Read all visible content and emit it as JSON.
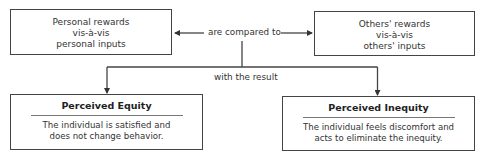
{
  "diagram": {
    "nodes": {
      "personal": {
        "lines": [
          "Personal rewards",
          "vis-à-vis",
          "personal inputs"
        ]
      },
      "others": {
        "lines": [
          "Others' rewards",
          "vis-à-vis",
          "others' inputs"
        ]
      },
      "equity": {
        "title": "Perceived Equity",
        "lines": [
          "The individual is satisfied and",
          "does not change behavior."
        ]
      },
      "inequity": {
        "title": "Perceived Inequity",
        "lines": [
          "The individual feels discomfort and",
          "acts to eliminate the inequity."
        ]
      }
    },
    "edges": {
      "compare_label": "are compared to",
      "result_label": "with the result"
    },
    "colors": {
      "stroke": "#444444",
      "text": "#333333",
      "background": "#ffffff"
    }
  }
}
